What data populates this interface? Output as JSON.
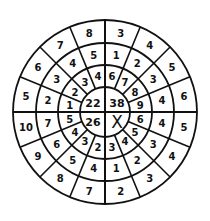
{
  "center": {
    "top_left": "22",
    "top_right": "38",
    "bottom_left": "26",
    "bottom_right": "X"
  },
  "rings_clockwise_from_top": {
    "inner": [
      "6",
      "7",
      "8",
      "9",
      "6",
      "5",
      "4",
      "3",
      "2",
      "3",
      "4",
      "5",
      "1",
      "2",
      "3",
      "4"
    ],
    "middle": [
      "1",
      "2",
      "3",
      "4",
      "4",
      "3",
      "2",
      "1",
      "4",
      "5",
      "6",
      "7",
      "2",
      "3",
      "4",
      "5"
    ],
    "outer": [
      "3",
      "4",
      "5",
      "6",
      "5",
      "4",
      "3",
      "2",
      "7",
      "8",
      "9",
      "10",
      "5",
      "6",
      "7",
      "8"
    ]
  }
}
